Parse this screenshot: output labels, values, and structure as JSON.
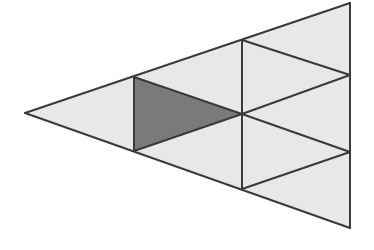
{
  "diagram": {
    "colors": {
      "background": "#ffffff",
      "light_fill": "#e8e8e8",
      "shaded_fill": "#7a7a7a",
      "stroke": "#3a3a3a"
    },
    "vertices": {
      "A": [
        25,
        113
      ],
      "B": [
        350,
        3
      ],
      "C": [
        350,
        228
      ],
      "D": [
        134,
        77
      ],
      "E": [
        134,
        151
      ],
      "F": [
        242,
        40
      ],
      "G": [
        242,
        114
      ],
      "H": [
        242,
        189
      ],
      "I": [
        350,
        75
      ],
      "J": [
        350,
        152
      ]
    },
    "triangles": [
      {
        "id": "t1",
        "points": "25,113 134,77 134,151",
        "fill": "#e8e8e8"
      },
      {
        "id": "t2-shaded",
        "points": "134,77 134,151 242,114",
        "fill": "#7a7a7a"
      },
      {
        "id": "t3",
        "points": "134,77 242,40 242,114",
        "fill": "#e8e8e8"
      },
      {
        "id": "t4",
        "points": "134,151 242,114 242,189",
        "fill": "#e8e8e8"
      },
      {
        "id": "t5",
        "points": "242,40 350,3 350,75",
        "fill": "#e8e8e8"
      },
      {
        "id": "t6",
        "points": "242,40 350,75 242,114",
        "fill": "#e8e8e8"
      },
      {
        "id": "t7",
        "points": "242,114 350,75 350,152",
        "fill": "#e8e8e8"
      },
      {
        "id": "t8",
        "points": "242,114 350,152 242,189",
        "fill": "#e8e8e8"
      },
      {
        "id": "t9",
        "points": "242,189 350,152 350,228",
        "fill": "#e8e8e8"
      }
    ],
    "edges": [
      {
        "x1": 25,
        "y1": 113,
        "x2": 350,
        "y2": 3
      },
      {
        "x1": 25,
        "y1": 113,
        "x2": 350,
        "y2": 228
      },
      {
        "x1": 350,
        "y1": 3,
        "x2": 350,
        "y2": 228
      },
      {
        "x1": 134,
        "y1": 77,
        "x2": 134,
        "y2": 151
      },
      {
        "x1": 242,
        "y1": 40,
        "x2": 242,
        "y2": 189
      },
      {
        "x1": 134,
        "y1": 77,
        "x2": 242,
        "y2": 114
      },
      {
        "x1": 134,
        "y1": 151,
        "x2": 242,
        "y2": 114
      },
      {
        "x1": 242,
        "y1": 40,
        "x2": 350,
        "y2": 75
      },
      {
        "x1": 350,
        "y1": 75,
        "x2": 242,
        "y2": 114
      },
      {
        "x1": 242,
        "y1": 114,
        "x2": 350,
        "y2": 152
      },
      {
        "x1": 350,
        "y1": 152,
        "x2": 242,
        "y2": 189
      }
    ]
  }
}
